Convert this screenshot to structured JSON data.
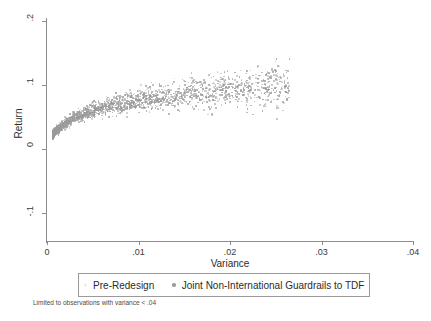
{
  "chart_data": {
    "type": "scatter",
    "title": "",
    "xlabel": "Variance",
    "ylabel": "Return",
    "xlim": [
      0,
      0.04
    ],
    "ylim": [
      -0.1,
      0.2
    ],
    "xticks": [
      "0",
      ".01",
      ".02",
      ".03",
      ".04"
    ],
    "xtick_values": [
      0,
      0.01,
      0.02,
      0.03,
      0.04
    ],
    "yticks": [
      ".2",
      ".1",
      "0",
      "-.1"
    ],
    "ytick_values": [
      0.2,
      0.1,
      0,
      -0.1
    ],
    "grid": false,
    "legend_position": "below-axis",
    "note": "Limited to observations with variance < .04",
    "series": [
      {
        "name": "Pre-Redesign",
        "marker": "dot",
        "color": "#efefef",
        "points": []
      },
      {
        "name": "Joint Non-International Guardrails to TDF",
        "marker": "dot",
        "color": "#9a9a9a",
        "points": [
          [
            0.0004,
            0.0235
          ],
          [
            0.0006,
            0.0255
          ],
          [
            0.0007,
            0.0268
          ],
          [
            0.0008,
            0.028
          ],
          [
            0.0009,
            0.0292
          ],
          [
            0.001,
            0.0305
          ],
          [
            0.0011,
            0.0318
          ],
          [
            0.0012,
            0.033
          ],
          [
            0.0013,
            0.0342
          ],
          [
            0.0014,
            0.0354
          ],
          [
            0.0015,
            0.0366
          ],
          [
            0.0016,
            0.0377
          ],
          [
            0.0017,
            0.0388
          ],
          [
            0.0018,
            0.0399
          ],
          [
            0.0019,
            0.0409
          ],
          [
            0.002,
            0.0419
          ],
          [
            0.0022,
            0.0438
          ],
          [
            0.0024,
            0.0456
          ],
          [
            0.0026,
            0.0473
          ],
          [
            0.0028,
            0.0489
          ],
          [
            0.003,
            0.0504
          ],
          [
            0.0032,
            0.0518
          ],
          [
            0.0034,
            0.0531
          ],
          [
            0.0036,
            0.0544
          ],
          [
            0.0038,
            0.0556
          ],
          [
            0.004,
            0.0567
          ],
          [
            0.0043,
            0.0583
          ],
          [
            0.0046,
            0.0598
          ],
          [
            0.0049,
            0.0612
          ],
          [
            0.0052,
            0.0625
          ],
          [
            0.0055,
            0.0637
          ],
          [
            0.0058,
            0.0649
          ],
          [
            0.0062,
            0.0663
          ],
          [
            0.0066,
            0.0677
          ],
          [
            0.007,
            0.069
          ],
          [
            0.0074,
            0.0702
          ],
          [
            0.0078,
            0.0714
          ],
          [
            0.0082,
            0.0725
          ],
          [
            0.0086,
            0.0736
          ],
          [
            0.009,
            0.0746
          ],
          [
            0.0095,
            0.0758
          ],
          [
            0.01,
            0.077
          ],
          [
            0.0105,
            0.0781
          ],
          [
            0.011,
            0.0792
          ],
          [
            0.0115,
            0.0802
          ],
          [
            0.012,
            0.0812
          ],
          [
            0.0126,
            0.0824
          ],
          [
            0.0132,
            0.0835
          ],
          [
            0.0138,
            0.0846
          ],
          [
            0.0144,
            0.0856
          ],
          [
            0.015,
            0.0866
          ],
          [
            0.0158,
            0.0879
          ],
          [
            0.0166,
            0.0891
          ],
          [
            0.0174,
            0.0903
          ],
          [
            0.0182,
            0.0914
          ],
          [
            0.019,
            0.0925
          ],
          [
            0.02,
            0.0938
          ],
          [
            0.021,
            0.0951
          ],
          [
            0.022,
            0.0963
          ],
          [
            0.0235,
            0.0981
          ],
          [
            0.025,
            0.0998
          ],
          [
            0.0265,
            0.1014
          ]
        ],
        "spread_note": "points scatter about the trend with vertical dispersion growing with variance; visible range of returns roughly 0.00 to 0.17"
      }
    ],
    "n_points_drawn": 2100,
    "cloud_description": "Dense gray point cloud originating near (0, 0.02) and rising to the upper right; densest core between variance 0.002 and 0.018, thinning markedly after 0.022 with sparse outliers out to about 0.027."
  }
}
